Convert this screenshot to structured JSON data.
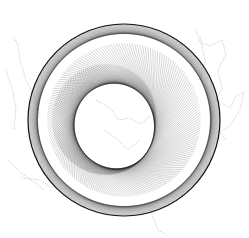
{
  "artwork": {
    "subject": "string-art spiral ring (yin-yang swirl) over faint map outline",
    "background": "#ffffff",
    "ring": {
      "cx": 124,
      "cy": 120,
      "outer_radius": 96,
      "inner_radius": 52,
      "stroke_color": "#111111",
      "line_count": 180
    },
    "map_overlay_color": "#b8b8b8"
  }
}
